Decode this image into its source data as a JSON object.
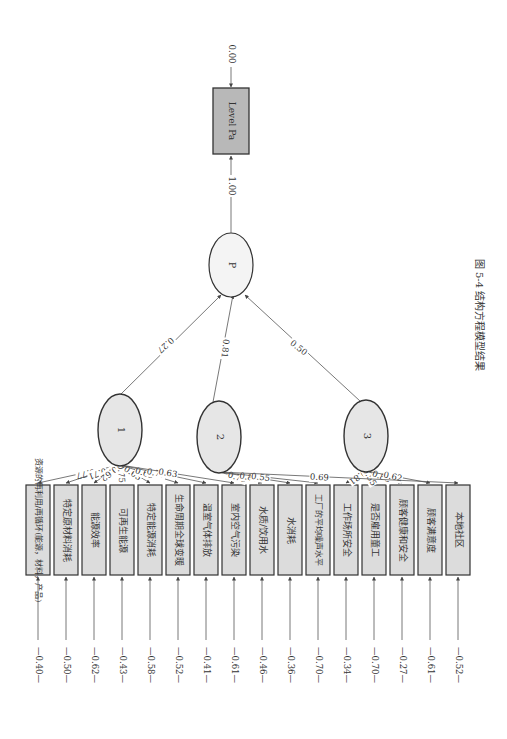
{
  "figure": {
    "caption_number": "图 5-4",
    "caption_text": "结构方程模型结果"
  },
  "colors": {
    "line": "#555555",
    "latent_fill": "#e6e6e6",
    "latent_stroke": "#333333",
    "box_fill": "#dcdcdc",
    "box_stroke": "#333333",
    "level_fill": "#b8b8b8",
    "p_fill": "#f4f4f4"
  },
  "outcome": {
    "label": "Level Pa",
    "error": "0.00",
    "path_from_p": "1.00"
  },
  "p_node": {
    "label": "P"
  },
  "latents": [
    {
      "id": "1",
      "label": "1",
      "path_to_p": "0.27"
    },
    {
      "id": "2",
      "label": "2",
      "path_to_p": "0.81"
    },
    {
      "id": "3",
      "label": "3",
      "path_to_p": "0.50"
    }
  ],
  "indicators": [
    {
      "label": "资源的再利用/再循环(能源，材料，产品)",
      "latent": "1",
      "loading": "0.77",
      "error": "0.40"
    },
    {
      "label": "特定原材料消耗",
      "latent": "1",
      "loading": "0.71",
      "error": "0.50"
    },
    {
      "label": "能源效率",
      "latent": "1",
      "loading": "0.62",
      "error": "0.62"
    },
    {
      "label": "可再生能源",
      "latent": "1",
      "loading": "0.75",
      "error": "0.43"
    },
    {
      "label": "特定能源消耗",
      "latent": "1",
      "loading": "0.65",
      "error": "0.58"
    },
    {
      "label": "生命周期全球变暖",
      "latent": "1",
      "loading": "0.69",
      "error": "0.52"
    },
    {
      "label": "温室气体排放",
      "latent": "1",
      "loading": "0.77",
      "error": "0.41"
    },
    {
      "label": "室内空气污染",
      "latent": "1",
      "loading": "0.63",
      "error": "0.61"
    },
    {
      "label": "水质/饮用水",
      "latent": "2",
      "loading": "0.73",
      "error": "0.46"
    },
    {
      "label": "水消耗",
      "latent": "2",
      "loading": "0.80",
      "error": "0.36"
    },
    {
      "label": "工厂的平均噪声水平",
      "latent": "2",
      "loading": "0.55",
      "error": "0.70"
    },
    {
      "label": "工作场所安全",
      "latent": "3",
      "loading": "0.81",
      "error": "0.34"
    },
    {
      "label": "是否雇用童工",
      "latent": "3",
      "loading": "0.55",
      "error": "0.70"
    },
    {
      "label": "顾客健康和安全",
      "latent": "3",
      "loading": "0.86",
      "error": "0.27"
    },
    {
      "label": "顾客满意度",
      "latent": "3",
      "loading": "0.62",
      "error": "0.61"
    },
    {
      "label": "本地社区",
      "latent": "2",
      "loading": "0.69",
      "error": "0.52"
    }
  ]
}
